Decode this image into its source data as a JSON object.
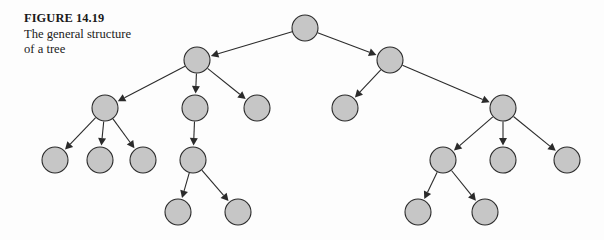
{
  "figure": {
    "caption_label": "FIGURE 14.19",
    "caption_line_1": "The general structure",
    "caption_line_2": "of a tree",
    "background_color": "#fdfdfd"
  },
  "diagram": {
    "title": "The general structure of a tree",
    "type": "tree",
    "node_fill_color": "#c6c6c6",
    "node_stroke_color": "#2b2b2b",
    "edge_color": "#2b2b2b",
    "node_radius": 13,
    "edge_style": "arrow",
    "node_count": 17,
    "edge_count": 16,
    "depth": 5,
    "nodes": [
      {
        "id": "n0",
        "label": "",
        "x": 305,
        "y": 28,
        "r": 13,
        "level": 0,
        "name": "root-node"
      },
      {
        "id": "n1",
        "label": "",
        "x": 197,
        "y": 60,
        "r": 13,
        "level": 1,
        "name": "node-left-child"
      },
      {
        "id": "n2",
        "label": "",
        "x": 390,
        "y": 60,
        "r": 13,
        "level": 1,
        "name": "node-right-child"
      },
      {
        "id": "n3",
        "label": "",
        "x": 105,
        "y": 108,
        "r": 13,
        "level": 2,
        "name": "node-l1"
      },
      {
        "id": "n4",
        "label": "",
        "x": 195,
        "y": 108,
        "r": 13,
        "level": 2,
        "name": "node-l2"
      },
      {
        "id": "n5",
        "label": "",
        "x": 257,
        "y": 108,
        "r": 13,
        "level": 2,
        "name": "node-l3"
      },
      {
        "id": "n6",
        "label": "",
        "x": 345,
        "y": 108,
        "r": 13,
        "level": 2,
        "name": "node-r1"
      },
      {
        "id": "n7",
        "label": "",
        "x": 503,
        "y": 108,
        "r": 13,
        "level": 2,
        "name": "node-r2"
      },
      {
        "id": "n8",
        "label": "",
        "x": 55,
        "y": 160,
        "r": 13,
        "level": 3,
        "name": "node-l1a"
      },
      {
        "id": "n9",
        "label": "",
        "x": 100,
        "y": 160,
        "r": 13,
        "level": 3,
        "name": "node-l1b"
      },
      {
        "id": "n10",
        "label": "",
        "x": 143,
        "y": 160,
        "r": 13,
        "level": 3,
        "name": "node-l1c"
      },
      {
        "id": "n11",
        "label": "",
        "x": 193,
        "y": 160,
        "r": 13,
        "level": 3,
        "name": "node-l2a"
      },
      {
        "id": "n12",
        "label": "",
        "x": 443,
        "y": 160,
        "r": 13,
        "level": 3,
        "name": "node-r2a"
      },
      {
        "id": "n13",
        "label": "",
        "x": 503,
        "y": 160,
        "r": 13,
        "level": 3,
        "name": "node-r2b"
      },
      {
        "id": "n14",
        "label": "",
        "x": 567,
        "y": 160,
        "r": 13,
        "level": 3,
        "name": "node-r2c"
      },
      {
        "id": "n15",
        "label": "",
        "x": 178,
        "y": 212,
        "r": 13,
        "level": 4,
        "name": "node-l2a1"
      },
      {
        "id": "n16",
        "label": "",
        "x": 238,
        "y": 212,
        "r": 13,
        "level": 4,
        "name": "node-l2a2"
      },
      {
        "id": "n17",
        "label": "",
        "x": 418,
        "y": 212,
        "r": 13,
        "level": 4,
        "name": "node-r2a1"
      },
      {
        "id": "n18",
        "label": "",
        "x": 485,
        "y": 212,
        "r": 13,
        "level": 4,
        "name": "node-r2a2"
      }
    ],
    "edges": [
      {
        "from": "n0",
        "to": "n1"
      },
      {
        "from": "n0",
        "to": "n2"
      },
      {
        "from": "n1",
        "to": "n3"
      },
      {
        "from": "n1",
        "to": "n4"
      },
      {
        "from": "n1",
        "to": "n5"
      },
      {
        "from": "n2",
        "to": "n6"
      },
      {
        "from": "n2",
        "to": "n7"
      },
      {
        "from": "n3",
        "to": "n8"
      },
      {
        "from": "n3",
        "to": "n9"
      },
      {
        "from": "n3",
        "to": "n10"
      },
      {
        "from": "n4",
        "to": "n11"
      },
      {
        "from": "n7",
        "to": "n12"
      },
      {
        "from": "n7",
        "to": "n13"
      },
      {
        "from": "n7",
        "to": "n14"
      },
      {
        "from": "n11",
        "to": "n15"
      },
      {
        "from": "n11",
        "to": "n16"
      },
      {
        "from": "n12",
        "to": "n17"
      },
      {
        "from": "n12",
        "to": "n18"
      }
    ]
  }
}
